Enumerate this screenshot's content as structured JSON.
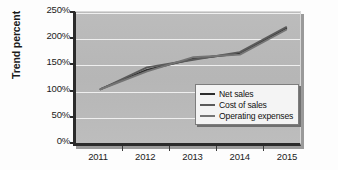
{
  "chart_data": {
    "type": "line",
    "title": "",
    "xlabel": "",
    "ylabel": "Trend percent",
    "categories": [
      "2011",
      "2012",
      "2013",
      "2014",
      "2015"
    ],
    "x_tick_labels": [
      "2011",
      "2012",
      "2013",
      "2014",
      "2015"
    ],
    "y_tick_labels": [
      "0%",
      "50%",
      "100%",
      "150%",
      "200%",
      "250%"
    ],
    "y_tick_values": [
      0,
      50,
      100,
      150,
      200,
      250
    ],
    "ylim": [
      0,
      250
    ],
    "grid": true,
    "legend_position": "lower-right-inside",
    "series": [
      {
        "name": "Net sales",
        "color": "#2e2e2e",
        "values": [
          100,
          138,
          160,
          170,
          220
        ]
      },
      {
        "name": "Cost of sales",
        "color": "#5a5a5a",
        "values": [
          100,
          143,
          158,
          173,
          222
        ]
      },
      {
        "name": "Operating expenses",
        "color": "#747474",
        "values": [
          100,
          135,
          163,
          168,
          217
        ]
      }
    ]
  },
  "axes": {
    "y_title": "Trend percent",
    "y_ticks": [
      {
        "label": "250%",
        "value": 250
      },
      {
        "label": "200%",
        "value": 200
      },
      {
        "label": "150%",
        "value": 150
      },
      {
        "label": "100%",
        "value": 100
      },
      {
        "label": "50%",
        "value": 50
      },
      {
        "label": "0%",
        "value": 0
      }
    ],
    "x_ticks": [
      {
        "label": "2011"
      },
      {
        "label": "2012"
      },
      {
        "label": "2013"
      },
      {
        "label": "2014"
      },
      {
        "label": "2015"
      }
    ]
  },
  "legend": {
    "entries": [
      {
        "label": "Net sales",
        "color": "#2e2e2e"
      },
      {
        "label": "Cost of sales",
        "color": "#5a5a5a"
      },
      {
        "label": "Operating expenses",
        "color": "#747474"
      }
    ]
  },
  "style": {
    "plot_background": "#b9b9b9",
    "gridline_color": "#efefef",
    "frame_color": "#2b2b2b",
    "page_background": "#fdfdfd",
    "text_color": "#1b1b1b"
  }
}
